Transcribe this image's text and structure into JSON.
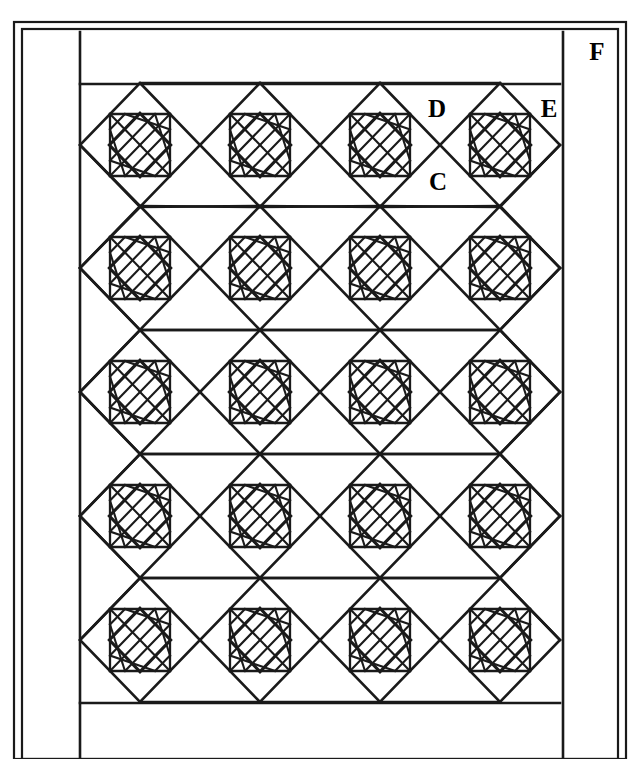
{
  "diagram": {
    "kind": "quilt-layout-line-drawing",
    "canvas": {
      "width": 640,
      "height": 759
    },
    "line_color": "#1a1a1a",
    "background_color": "#ffffff",
    "labels": [
      {
        "key": "C",
        "text": "C",
        "meaning": "setting square (plain on-point square)",
        "x": 438,
        "y": 190
      },
      {
        "key": "D",
        "text": "D",
        "meaning": "side setting triangle",
        "x": 437,
        "y": 117
      },
      {
        "key": "E",
        "text": "E",
        "meaning": "corner setting triangle",
        "x": 549,
        "y": 117
      },
      {
        "key": "F",
        "text": "F",
        "meaning": "outer border strip",
        "x": 597,
        "y": 60
      }
    ],
    "frame": {
      "outer_rect": {
        "x": 14,
        "y": 22,
        "width": 612,
        "height": 737
      },
      "inner_rect": {
        "x": 22,
        "y": 29,
        "width": 596,
        "height": 730
      },
      "border_rect": {
        "x": 80,
        "y": 32,
        "width": 483,
        "height": 727
      },
      "field_rect": {
        "x": 80,
        "y": 84,
        "width": 480,
        "height": 619
      }
    },
    "grid": {
      "columns": 4,
      "rows": 5,
      "block_width": 120,
      "block_height": 124,
      "column_centers": [
        140,
        260,
        380,
        500
      ],
      "row_centers": [
        145,
        268,
        392,
        516,
        640
      ],
      "block_name": "pieced on-point block",
      "inner_lattice_divisions": 4
    }
  }
}
